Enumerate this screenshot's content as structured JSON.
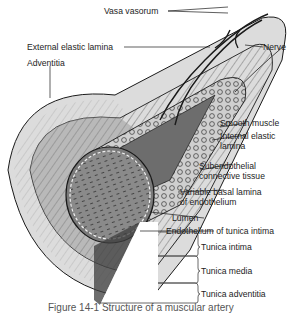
{
  "diagram": {
    "title": "Structure of a muscular artery",
    "labels": {
      "vasa_vasorum": "Vasa vasorum",
      "external_elastic_lamina": "External elastic lamina",
      "nerve": "Nerve",
      "adventitia": "Adventitia",
      "smooth_muscle": "Smooth muscle",
      "internal_elastic_lamina_1": "Internal elastic",
      "internal_elastic_lamina_2": "lamina",
      "subendothelial_1": "Subendothelial",
      "subendothelial_2": "connective tissue",
      "basal_lamina_1": "Variable basal lamina",
      "basal_lamina_2": "of endothelium",
      "lumen": "Lumen",
      "endothelium": "Endothelium of tunica intima",
      "tunica_intima": "Tunica intima",
      "tunica_media": "Tunica media",
      "tunica_adventitia": "Tunica adventitia"
    },
    "caption": "Figure 14-1 Structure of a muscular artery",
    "colors": {
      "line": "#1a1a1a",
      "adventitia_fill": "#d8d8d8",
      "media_fill": "#9a9a9a",
      "intima_fill": "#7c7c7c",
      "lumen_fill": "#8e8e8e",
      "background": "#ffffff"
    }
  }
}
